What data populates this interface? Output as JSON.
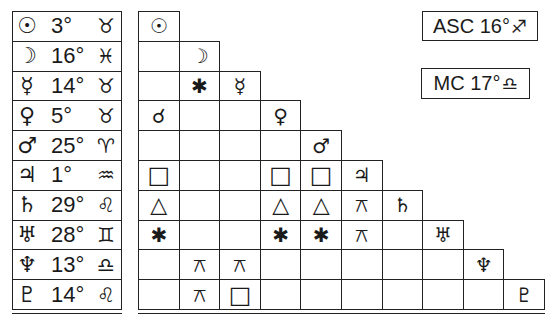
{
  "planets": [
    {
      "name": "Sun",
      "glyph": "☉",
      "degree": "3°",
      "sign": "Taurus",
      "sign_glyph": "♉"
    },
    {
      "name": "Moon",
      "glyph": "☽",
      "degree": "16°",
      "sign": "Pisces",
      "sign_glyph": "♓"
    },
    {
      "name": "Mercury",
      "glyph": "☿",
      "degree": "14°",
      "sign": "Taurus",
      "sign_glyph": "♉"
    },
    {
      "name": "Venus",
      "glyph": "♀",
      "degree": "5°",
      "sign": "Taurus",
      "sign_glyph": "♉"
    },
    {
      "name": "Mars",
      "glyph": "♂",
      "degree": "25°",
      "sign": "Aries",
      "sign_glyph": "♈"
    },
    {
      "name": "Jupiter",
      "glyph": "♃",
      "degree": "1°",
      "sign": "Aquarius",
      "sign_glyph": "♒"
    },
    {
      "name": "Saturn",
      "glyph": "♄",
      "degree": "29°",
      "sign": "Leo",
      "sign_glyph": "♌"
    },
    {
      "name": "Uranus",
      "glyph": "♅",
      "degree": "28°",
      "sign": "Gemini",
      "sign_glyph": "♊"
    },
    {
      "name": "Neptune",
      "glyph": "♆",
      "degree": "13°",
      "sign": "Libra",
      "sign_glyph": "♎"
    },
    {
      "name": "Pluto",
      "glyph": "♇",
      "degree": "14°",
      "sign": "Leo",
      "sign_glyph": "♌"
    }
  ],
  "aspect_grid": {
    "legend": {
      "conjunction": "☌",
      "sextile": "✱",
      "square": "□",
      "trine": "△",
      "quincunx": "⚻"
    },
    "rows": [
      [
        "☉"
      ],
      [
        "",
        "☽"
      ],
      [
        "",
        "✱",
        "☿"
      ],
      [
        "☌",
        "",
        "",
        "♀"
      ],
      [
        "",
        "",
        "",
        "",
        "♂"
      ],
      [
        "□",
        "",
        "",
        "□",
        "□",
        "♃"
      ],
      [
        "△",
        "",
        "",
        "△",
        "△",
        "⚻",
        "♄"
      ],
      [
        "✱",
        "",
        "",
        "✱",
        "✱",
        "⚻",
        "",
        "♅"
      ],
      [
        "",
        "⚻",
        "⚻",
        "",
        "",
        "",
        "",
        "",
        "♆"
      ],
      [
        "",
        "⚻",
        "□",
        "",
        "",
        "",
        "",
        "",
        "",
        "♇"
      ]
    ]
  },
  "angles": {
    "asc": {
      "label": "ASC",
      "degree": "16°",
      "sign": "Sagittarius",
      "sign_glyph": "♐"
    },
    "mc": {
      "label": "MC",
      "degree": "17°",
      "sign": "Libra",
      "sign_glyph": "♎"
    }
  }
}
